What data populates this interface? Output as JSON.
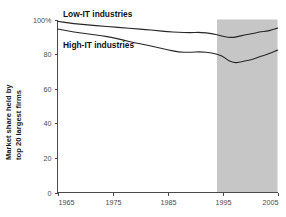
{
  "chart_data": {
    "type": "line",
    "title": "",
    "subtitle": "",
    "xlabel": "",
    "ylabel": "Market share held by top 20 largest firms",
    "ylabel_line1": "Market share held by",
    "ylabel_line2": "top 20 largest firms",
    "xlim": [
      1965,
      2005
    ],
    "ylim": [
      0,
      100
    ],
    "grid": false,
    "legend_position": "inline-annotation",
    "xticks": [
      1965,
      1975,
      1985,
      1995,
      2005
    ],
    "xtick_labels": [
      "1965",
      "1975",
      "1985",
      "1995",
      "2005"
    ],
    "yticks": [
      0,
      20,
      40,
      60,
      80,
      100
    ],
    "ytick_labels": [
      "0",
      "20",
      "40",
      "60",
      "80",
      "100%"
    ],
    "shaded_region": {
      "label": "",
      "x_start": 1994,
      "x_end": 2005,
      "color": "#c6c6c6"
    },
    "series": [
      {
        "name": "Low-IT industries",
        "color": "#262626",
        "x": [
          1965,
          1967,
          1969,
          1971,
          1973,
          1975,
          1977,
          1979,
          1981,
          1983,
          1985,
          1987,
          1989,
          1991,
          1993,
          1995,
          1996,
          1997,
          1998,
          1999,
          2000,
          2001,
          2002,
          2003,
          2004,
          2005
        ],
        "values": [
          99.0,
          98.0,
          97.3,
          96.7,
          96.2,
          95.7,
          95.2,
          94.7,
          94.2,
          93.6,
          93.0,
          92.6,
          92.4,
          92.6,
          92.0,
          90.4,
          89.7,
          89.6,
          90.3,
          91.0,
          91.6,
          92.2,
          93.0,
          93.1,
          94.0,
          95.0
        ]
      },
      {
        "name": "High-IT industries",
        "color": "#262626",
        "x": [
          1965,
          1967,
          1969,
          1971,
          1973,
          1975,
          1977,
          1979,
          1981,
          1983,
          1985,
          1987,
          1989,
          1991,
          1993,
          1995,
          1996,
          1997,
          1998,
          1999,
          2000,
          2001,
          2002,
          2003,
          2004,
          2005
        ],
        "values": [
          94.5,
          93.3,
          92.3,
          91.5,
          90.6,
          89.6,
          88.0,
          86.6,
          85.3,
          84.0,
          82.5,
          81.2,
          81.0,
          81.4,
          80.8,
          79.0,
          76.4,
          75.0,
          75.2,
          76.0,
          76.6,
          77.5,
          78.8,
          79.6,
          81.0,
          82.3
        ]
      }
    ],
    "annotations": [
      {
        "text": "Low-IT industries",
        "x": 1967,
        "y": 101
      },
      {
        "text": "High-IT industries",
        "x": 1967,
        "y": 87
      }
    ]
  }
}
